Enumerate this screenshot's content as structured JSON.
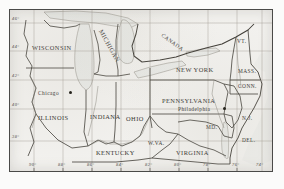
{
  "figure": {
    "kind": "scanned-reference-map",
    "region_description": "Great Lakes and Northeastern United States",
    "frame_color": "#4a4a48",
    "paper_color": "#f2f1ee",
    "ink_color": "#35332f",
    "water_color": "#e8e9e6",
    "graticule_color": "#9a968c"
  },
  "graticule": {
    "latitude_ticks": [
      {
        "label": "46°",
        "value": 46
      },
      {
        "label": "44°",
        "value": 44
      },
      {
        "label": "42°",
        "value": 42
      },
      {
        "label": "40°",
        "value": 40
      },
      {
        "label": "38°",
        "value": 38
      }
    ],
    "longitude_ticks": [
      {
        "label": "90°",
        "value": -90
      },
      {
        "label": "88°",
        "value": -88
      },
      {
        "label": "86°",
        "value": -86
      },
      {
        "label": "84°",
        "value": -84
      },
      {
        "label": "82°",
        "value": -82
      },
      {
        "label": "80°",
        "value": -80
      },
      {
        "label": "78°",
        "value": -78
      },
      {
        "label": "76°",
        "value": -76
      },
      {
        "label": "74°",
        "value": -74
      }
    ]
  },
  "labels": {
    "countries": [
      {
        "name": "CANADA",
        "text": "CANADA"
      }
    ],
    "states": [
      {
        "name": "wisconsin",
        "text": "WISCONSIN"
      },
      {
        "name": "michigan",
        "text": "MICHIGAN"
      },
      {
        "name": "new-york",
        "text": "NEW YORK"
      },
      {
        "name": "vermont",
        "text": "VT."
      },
      {
        "name": "massachusetts",
        "text": "MASS."
      },
      {
        "name": "connecticut",
        "text": "CONN."
      },
      {
        "name": "illinois",
        "text": "ILLINOIS"
      },
      {
        "name": "indiana",
        "text": "INDIANA"
      },
      {
        "name": "ohio",
        "text": "OHIO"
      },
      {
        "name": "pennsylvania",
        "text": "PENNSYLVANIA"
      },
      {
        "name": "new-jersey",
        "text": "N.J."
      },
      {
        "name": "maryland",
        "text": "MD."
      },
      {
        "name": "delaware",
        "text": "DEL."
      },
      {
        "name": "kentucky",
        "text": "KENTUCKY"
      },
      {
        "name": "west-virginia",
        "text": "W.VA."
      },
      {
        "name": "virginia",
        "text": "VIRGINIA"
      }
    ],
    "cities": [
      {
        "name": "chicago",
        "text": "Chicago"
      },
      {
        "name": "philadelphia",
        "text": "Philadelphia"
      }
    ]
  }
}
